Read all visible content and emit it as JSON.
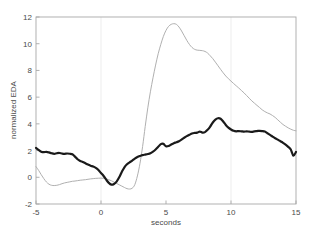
{
  "chart_data": {
    "type": "line",
    "title": "",
    "xlabel": "seconds",
    "ylabel": "normalized EDA",
    "xlim": [
      -5,
      15
    ],
    "ylim": [
      -2,
      12
    ],
    "xticks": [
      -5,
      0,
      5,
      10,
      15
    ],
    "xtick_labels": [
      "-5",
      "0",
      "5",
      "10",
      "15"
    ],
    "yticks": [
      -2,
      0,
      2,
      4,
      6,
      8,
      10,
      12
    ],
    "ytick_labels": [
      "-2",
      "0",
      "2",
      "4",
      "6",
      "8",
      "10",
      "12"
    ],
    "grid": "faint vertical gridlines at x = 0 and x = 10",
    "gridlines_x": [
      0,
      10
    ],
    "legend": "none",
    "series": [
      {
        "name": "thick-black-curve",
        "color": "#1a1a1a",
        "linewidth": 2.2,
        "x": [
          -5.0,
          -4.8,
          -4.6,
          -4.4,
          -4.2,
          -4.0,
          -3.8,
          -3.6,
          -3.4,
          -3.2,
          -3.0,
          -2.8,
          -2.6,
          -2.4,
          -2.2,
          -2.0,
          -1.8,
          -1.6,
          -1.4,
          -1.2,
          -1.0,
          -0.8,
          -0.6,
          -0.4,
          -0.2,
          0.0,
          0.2,
          0.4,
          0.6,
          0.8,
          1.0,
          1.2,
          1.4,
          1.6,
          1.8,
          2.0,
          2.2,
          2.4,
          2.6,
          2.8,
          3.0,
          3.2,
          3.4,
          3.6,
          3.8,
          4.0,
          4.2,
          4.4,
          4.6,
          4.8,
          5.0,
          5.2,
          5.4,
          5.6,
          5.8,
          6.0,
          6.2,
          6.4,
          6.6,
          6.8,
          7.0,
          7.2,
          7.4,
          7.6,
          7.8,
          8.0,
          8.2,
          8.4,
          8.6,
          8.8,
          9.0,
          9.2,
          9.4,
          9.6,
          9.8,
          10.0,
          10.2,
          10.4,
          10.6,
          10.8,
          11.0,
          11.2,
          11.4,
          11.6,
          11.8,
          12.0,
          12.2,
          12.4,
          12.6,
          12.8,
          13.0,
          13.2,
          13.4,
          13.6,
          13.8,
          14.0,
          14.2,
          14.4,
          14.6,
          14.8,
          15.0
        ],
        "y": [
          2.2,
          2.05,
          1.92,
          1.88,
          1.9,
          1.86,
          1.8,
          1.76,
          1.8,
          1.82,
          1.78,
          1.76,
          1.78,
          1.76,
          1.72,
          1.55,
          1.35,
          1.22,
          1.15,
          1.05,
          0.95,
          0.86,
          0.8,
          0.7,
          0.55,
          0.32,
          0.1,
          -0.18,
          -0.42,
          -0.55,
          -0.5,
          -0.32,
          0.0,
          0.4,
          0.75,
          0.98,
          1.12,
          1.25,
          1.4,
          1.52,
          1.6,
          1.66,
          1.7,
          1.74,
          1.8,
          1.92,
          2.08,
          2.28,
          2.48,
          2.5,
          2.32,
          2.34,
          2.45,
          2.55,
          2.62,
          2.7,
          2.82,
          2.96,
          3.08,
          3.18,
          3.28,
          3.32,
          3.34,
          3.42,
          3.35,
          3.38,
          3.55,
          3.8,
          4.1,
          4.32,
          4.42,
          4.38,
          4.18,
          3.92,
          3.72,
          3.58,
          3.48,
          3.44,
          3.46,
          3.44,
          3.42,
          3.44,
          3.42,
          3.4,
          3.44,
          3.46,
          3.48,
          3.46,
          3.42,
          3.3,
          3.18,
          3.04,
          2.92,
          2.82,
          2.7,
          2.58,
          2.44,
          2.28,
          2.08,
          1.62,
          1.9
        ]
      },
      {
        "name": "thin-gray-curve",
        "color": "#b0b0b0",
        "linewidth": 1.0,
        "x": [
          -5.0,
          -4.8,
          -4.6,
          -4.4,
          -4.2,
          -4.0,
          -3.8,
          -3.6,
          -3.4,
          -3.2,
          -3.0,
          -2.8,
          -2.6,
          -2.4,
          -2.2,
          -2.0,
          -1.8,
          -1.6,
          -1.4,
          -1.2,
          -1.0,
          -0.8,
          -0.6,
          -0.4,
          -0.2,
          0.0,
          0.2,
          0.4,
          0.6,
          0.8,
          1.0,
          1.2,
          1.4,
          1.6,
          1.8,
          2.0,
          2.2,
          2.4,
          2.6,
          2.8,
          3.0,
          3.2,
          3.4,
          3.6,
          3.8,
          4.0,
          4.2,
          4.4,
          4.6,
          4.8,
          5.0,
          5.2,
          5.4,
          5.6,
          5.8,
          6.0,
          6.2,
          6.4,
          6.6,
          6.8,
          7.0,
          7.2,
          7.4,
          7.6,
          7.8,
          8.0,
          8.2,
          8.4,
          8.6,
          8.8,
          9.0,
          9.2,
          9.4,
          9.6,
          9.8,
          10.0,
          10.2,
          10.4,
          10.6,
          10.8,
          11.0,
          11.2,
          11.4,
          11.6,
          11.8,
          12.0,
          12.2,
          12.4,
          12.6,
          12.8,
          13.0,
          13.2,
          13.4,
          13.6,
          13.8,
          14.0,
          14.2,
          14.4,
          14.6,
          14.8,
          15.0
        ],
        "y": [
          0.8,
          0.52,
          0.2,
          -0.1,
          -0.35,
          -0.52,
          -0.6,
          -0.62,
          -0.6,
          -0.55,
          -0.48,
          -0.42,
          -0.38,
          -0.34,
          -0.3,
          -0.28,
          -0.25,
          -0.22,
          -0.2,
          -0.18,
          -0.15,
          -0.12,
          -0.1,
          -0.08,
          -0.07,
          -0.06,
          -0.08,
          -0.12,
          -0.18,
          -0.26,
          -0.36,
          -0.46,
          -0.56,
          -0.66,
          -0.76,
          -0.85,
          -0.88,
          -0.82,
          -0.55,
          0.1,
          1.05,
          2.3,
          3.8,
          5.2,
          6.4,
          7.45,
          8.4,
          9.25,
          9.95,
          10.55,
          11.0,
          11.3,
          11.45,
          11.5,
          11.45,
          11.25,
          10.95,
          10.6,
          10.25,
          9.95,
          9.72,
          9.58,
          9.52,
          9.5,
          9.48,
          9.42,
          9.3,
          9.1,
          8.88,
          8.62,
          8.35,
          8.08,
          7.82,
          7.58,
          7.38,
          7.2,
          7.02,
          6.85,
          6.68,
          6.5,
          6.32,
          6.12,
          5.92,
          5.72,
          5.55,
          5.38,
          5.22,
          5.05,
          4.92,
          4.82,
          4.74,
          4.62,
          4.48,
          4.3,
          4.12,
          3.95,
          3.82,
          3.7,
          3.6,
          3.52,
          3.48
        ]
      }
    ]
  },
  "axes": {
    "xlabel_text": "seconds",
    "ylabel_text": "normalized EDA"
  }
}
